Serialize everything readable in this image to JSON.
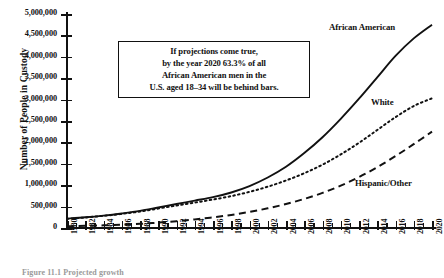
{
  "chart_data": {
    "type": "line",
    "title": "",
    "xlabel": "",
    "ylabel": "Number of People in Custody",
    "xlim": [
      1980,
      2020
    ],
    "ylim": [
      0,
      5000000
    ],
    "grid": false,
    "legend_position": "inline-end-of-line",
    "y_ticks": [
      "0",
      "500,000",
      "1,000,000",
      "1,500,000",
      "2,000,000",
      "2,500,000",
      "3,000,000",
      "3,500,000",
      "4,000,000",
      "4,500,000",
      "5,000,000"
    ],
    "y_tick_values": [
      0,
      500000,
      1000000,
      1500000,
      2000000,
      2500000,
      3000000,
      3500000,
      4000000,
      4500000,
      5000000
    ],
    "x_ticks": [
      "1980",
      "1982",
      "1984",
      "1986",
      "1988",
      "1990",
      "1992",
      "1994",
      "1996",
      "1998",
      "2000",
      "2002",
      "2004",
      "2006",
      "2008",
      "2010",
      "2012",
      "2014",
      "2016",
      "2018",
      "2020"
    ],
    "x_tick_values": [
      1980,
      1982,
      1984,
      1986,
      1988,
      1990,
      1992,
      1994,
      1996,
      1998,
      2000,
      2002,
      2004,
      2006,
      2008,
      2010,
      2012,
      2014,
      2016,
      2018,
      2020
    ],
    "x": [
      1980,
      1982,
      1984,
      1986,
      1988,
      1990,
      1992,
      1994,
      1996,
      1998,
      2000,
      2002,
      2004,
      2006,
      2008,
      2010,
      2012,
      2014,
      2016,
      2018,
      2020
    ],
    "series": [
      {
        "name": "African American",
        "style": "solid",
        "color": "#111111",
        "values": [
          220000,
          250000,
          290000,
          340000,
          400000,
          480000,
          560000,
          640000,
          720000,
          830000,
          980000,
          1180000,
          1430000,
          1750000,
          2120000,
          2550000,
          3020000,
          3520000,
          4020000,
          4430000,
          4750000
        ]
      },
      {
        "name": "White",
        "style": "dotted",
        "color": "#111111",
        "values": [
          215000,
          245000,
          285000,
          330000,
          385000,
          455000,
          525000,
          595000,
          665000,
          745000,
          845000,
          965000,
          1110000,
          1280000,
          1480000,
          1720000,
          1990000,
          2290000,
          2590000,
          2850000,
          3030000
        ]
      },
      {
        "name": "Hispanic/Other",
        "style": "dashed",
        "color": "#111111",
        "values": [
          40000,
          50000,
          62000,
          78000,
          98000,
          125000,
          160000,
          200000,
          248000,
          305000,
          375000,
          460000,
          560000,
          680000,
          820000,
          990000,
          1190000,
          1420000,
          1680000,
          1960000,
          2250000
        ]
      }
    ],
    "annotations": [
      {
        "name": "projection-note",
        "lines": [
          "If projections come true,",
          "by the year 2020 63.3% of all",
          "African American men in the",
          "U.S. aged 18–34 will be behind bars."
        ]
      }
    ]
  },
  "caption": "Figure 11.1  Projected growth",
  "colors": {
    "ink": "#111111",
    "background": "#ffffff"
  }
}
